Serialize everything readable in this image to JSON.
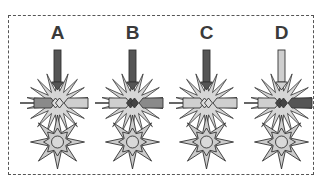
{
  "figure": {
    "panels": [
      {
        "label": "A",
        "top_arrow": "#555555",
        "left_bar": "#8a8a8a",
        "right_bar": "#cfcfcf",
        "center": "#dddddd"
      },
      {
        "label": "B",
        "top_arrow": "#555555",
        "left_bar": "#cfcfcf",
        "right_bar": "#8a8a8a",
        "center": "#444444"
      },
      {
        "label": "C",
        "top_arrow": "#555555",
        "left_bar": "#cfcfcf",
        "right_bar": "#cfcfcf",
        "center": "#dddddd"
      },
      {
        "label": "D",
        "top_arrow": "#cfcfcf",
        "left_bar": "#cfcfcf",
        "right_bar": "#555555",
        "center": "#444444"
      }
    ],
    "colors": {
      "burst_fill": "#d6d6d6",
      "star_fill": "#cccccc",
      "outline": "#333333",
      "frame": "#555555"
    }
  }
}
